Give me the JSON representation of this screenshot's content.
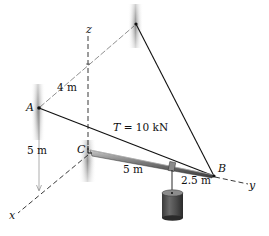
{
  "figure": {
    "type": "3D statics diagram",
    "points": {
      "A": "A",
      "B": "B",
      "C": "C"
    },
    "axes": {
      "x": "x",
      "y": "y",
      "z": "z"
    },
    "dimensions": {
      "d_top": "4 m",
      "d_vertical": "5 m",
      "d_CB_part": "5 m",
      "d_load_to_B": "2.5 m"
    },
    "tension": {
      "symbol": "T",
      "equals": " = 10 kN"
    },
    "colors": {
      "line": "#111111",
      "wall_shade": "#8a8a8a",
      "boom": "#6e6e6e",
      "cylinder": "#4a4a4a"
    }
  }
}
